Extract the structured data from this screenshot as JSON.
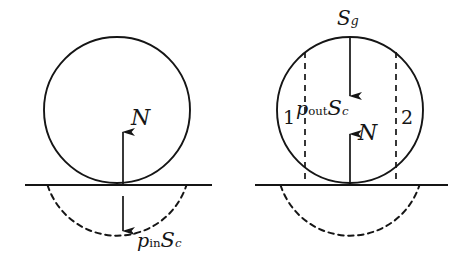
{
  "figure": {
    "background_color": "#ffffff",
    "stroke_color": "#151515",
    "panels": [
      {
        "id": "left-panel",
        "name": "internal-pressure-diagram",
        "circle": {
          "cx": 117,
          "cy": 110,
          "r": 73
        },
        "ground_line": {
          "y": 185,
          "x1": 25,
          "x2": 212
        },
        "dashed_arc": {
          "description": "submerged lower cap of circle below ground line"
        },
        "arrows": [
          {
            "name": "normal-force-arrow",
            "direction": "up",
            "x": 123,
            "y_tail": 185,
            "y_head": 130,
            "label": "N"
          },
          {
            "name": "internal-pressure-arrow",
            "direction": "down",
            "x": 123,
            "y_tail": 196,
            "y_head": 233,
            "label_base": "p",
            "label_sub": "in",
            "label_second": "S",
            "label_second_sub": "c"
          }
        ]
      },
      {
        "id": "right-panel",
        "name": "external-pressure-diagram",
        "circle": {
          "cx": 350,
          "cy": 110,
          "r": 73
        },
        "ground_line": {
          "y": 185,
          "x1": 255,
          "x2": 448
        },
        "dashed_arc": {
          "description": "submerged lower cap of circle below ground line"
        },
        "dashed_verticals": [
          {
            "name": "left-chord",
            "x": 305,
            "y1": 52,
            "y2": 185
          },
          {
            "name": "right-chord",
            "x": 396,
            "y1": 52,
            "y2": 185
          }
        ],
        "region_labels": [
          {
            "name": "region-1-label",
            "text": "1",
            "x": 284,
            "y": 106
          },
          {
            "name": "region-2-label",
            "text": "2",
            "x": 401,
            "y": 106
          }
        ],
        "arrows": [
          {
            "name": "surface-tension-arrow",
            "direction": "down",
            "x": 350,
            "y_tail": 37,
            "y_head": 98,
            "label_base": "S",
            "label_sub": "g"
          },
          {
            "name": "external-pressure-label",
            "label_base": "p",
            "label_sub": "out",
            "label_second": "S",
            "label_second_sub": "c"
          },
          {
            "name": "normal-force-arrow",
            "direction": "up",
            "x": 350,
            "y_tail": 185,
            "y_head": 132,
            "label": "N"
          }
        ]
      }
    ]
  },
  "labels": {
    "left_N": "N",
    "left_p_base": "p",
    "left_p_sub": "in",
    "left_S_base": "S",
    "left_S_sub": "c",
    "right_Sg_base": "S",
    "right_Sg_sub": "g",
    "right_p_base": "p",
    "right_p_sub": "out",
    "right_S_base": "S",
    "right_S_sub": "c",
    "right_N": "N",
    "region_1": "1",
    "region_2": "2"
  }
}
